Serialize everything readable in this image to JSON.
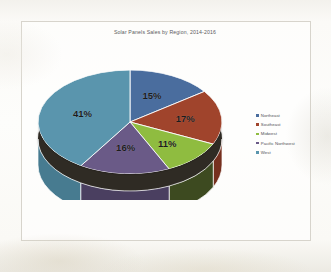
{
  "document": {
    "type": "scanned-page",
    "background_color": "#fbfaf7",
    "frame_color": "#d7d4cc"
  },
  "chart_data": {
    "type": "pie",
    "title": "Solar Panels Sales by Region, 2014-2016",
    "xlabel": "",
    "ylabel": "",
    "legend_position": "right",
    "three_d": true,
    "categories": [
      "Northeast",
      "Southeast",
      "Midwest",
      "Pacific Northwest",
      "West"
    ],
    "values": [
      15,
      17,
      11,
      16,
      41
    ],
    "value_labels": [
      "15%",
      "17%",
      "11%",
      "16%",
      "41%"
    ],
    "colors": [
      "#4a6d9e",
      "#a0442c",
      "#8fbc40",
      "#6a5a87",
      "#5a95ad"
    ],
    "side_colors": [
      "#36507a",
      "#76301f",
      "#3d4a20",
      "#4a3f60",
      "#477b90"
    ],
    "slices": [
      {
        "label": "Northeast",
        "value": 15,
        "display": "15%",
        "color": "#4a6d9e"
      },
      {
        "label": "Southeast",
        "value": 17,
        "display": "17%",
        "color": "#a0442c"
      },
      {
        "label": "Midwest",
        "value": 11,
        "display": "11%",
        "color": "#8fbc40"
      },
      {
        "label": "Pacific Northwest",
        "value": 16,
        "display": "16%",
        "color": "#6a5a87"
      },
      {
        "label": "West",
        "value": 41,
        "display": "41%",
        "color": "#5a95ad"
      }
    ]
  },
  "legend": {
    "items": [
      {
        "label": "Northeast",
        "color": "#4a6d9e"
      },
      {
        "label": "Southeast",
        "color": "#a0442c"
      },
      {
        "label": "Midwest",
        "color": "#8fbc40"
      },
      {
        "label": "Pacific Northwest",
        "color": "#6a5a87"
      },
      {
        "label": "West",
        "color": "#5a95ad"
      }
    ]
  }
}
